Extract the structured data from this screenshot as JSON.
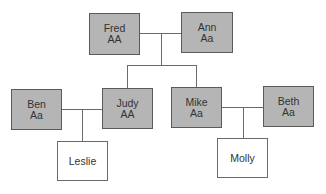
{
  "diagram": {
    "type": "family-tree",
    "colors": {
      "affected_fill": "#b5b5b5",
      "unaffected_fill": "#ffffff",
      "border": "#5a5a5a",
      "line": "#6a6a6a",
      "text": "#333333"
    },
    "nodes": {
      "fred": {
        "name": "Fred",
        "genotype": "AA"
      },
      "ann": {
        "name": "Ann",
        "genotype": "Aa"
      },
      "ben": {
        "name": "Ben",
        "genotype": "Aa"
      },
      "judy": {
        "name": "Judy",
        "genotype": "AA"
      },
      "mike": {
        "name": "Mike",
        "genotype": "Aa"
      },
      "beth": {
        "name": "Beth",
        "genotype": "Aa"
      },
      "leslie": {
        "name": "Leslie"
      },
      "molly": {
        "name": "Molly"
      }
    },
    "relationships": [
      {
        "type": "couple",
        "members": [
          "Fred",
          "Ann"
        ],
        "children": [
          "Judy",
          "Mike"
        ]
      },
      {
        "type": "couple",
        "members": [
          "Ben",
          "Judy"
        ],
        "children": [
          "Leslie"
        ]
      },
      {
        "type": "couple",
        "members": [
          "Mike",
          "Beth"
        ],
        "children": [
          "Molly"
        ]
      }
    ]
  }
}
